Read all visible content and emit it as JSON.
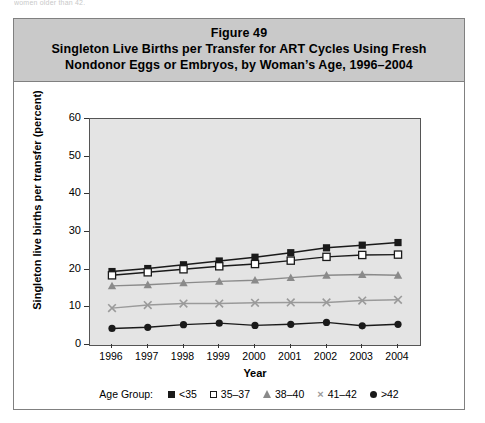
{
  "page": {
    "cut_off_top_text": "women older than 42."
  },
  "figure": {
    "figure_number": "Figure 49",
    "title_line_1": "Singleton Live Births per Transfer for ART Cycles Using Fresh",
    "title_line_2": "Nondonor Eggs or Embryos, by Woman’s Age, 1996–2004",
    "legend_title": "Age Group:"
  },
  "colors": {
    "title_band": "#c9c9c9",
    "plot_background": "#e4e4e4",
    "frame": "#808080",
    "series_lt35": "#1a1a1a",
    "series_35_37": "#1a1a1a",
    "series_38_40": "#8a8a8a",
    "series_41_42": "#9a9a9a",
    "series_gt42": "#1a1a1a"
  },
  "chart_data": {
    "type": "line",
    "xlabel": "Year",
    "ylabel": "Singleton live births per transfer (percent)",
    "categories": [
      "1996",
      "1997",
      "1998",
      "1999",
      "2000",
      "2001",
      "2002",
      "2003",
      "2004"
    ],
    "x": [
      1996,
      1997,
      1998,
      1999,
      2000,
      2001,
      2002,
      2003,
      2004
    ],
    "ylim": [
      0,
      60
    ],
    "yticks": [
      0,
      10,
      20,
      30,
      40,
      50,
      60
    ],
    "grid": false,
    "legend_position": "bottom",
    "series": [
      {
        "name": "<35",
        "marker": "filled-square",
        "color": "#1a1a1a",
        "values": [
          19.5,
          20.3,
          21.3,
          22.3,
          23.3,
          24.5,
          25.8,
          26.5,
          27.2
        ]
      },
      {
        "name": "35–37",
        "marker": "open-square",
        "color": "#1a1a1a",
        "values": [
          18.5,
          19.3,
          20.1,
          20.9,
          21.5,
          22.4,
          23.4,
          23.9,
          24.0
        ]
      },
      {
        "name": "38–40",
        "marker": "filled-triangle",
        "color": "#8a8a8a",
        "values": [
          15.7,
          16.0,
          16.5,
          16.9,
          17.2,
          17.9,
          18.5,
          18.7,
          18.5
        ]
      },
      {
        "name": "41–42",
        "marker": "cross-x",
        "color": "#9a9a9a",
        "values": [
          9.8,
          10.6,
          11.0,
          11.0,
          11.2,
          11.3,
          11.3,
          11.8,
          12.0
        ]
      },
      {
        "name": ">42",
        "marker": "filled-circle",
        "color": "#1a1a1a",
        "values": [
          4.4,
          4.7,
          5.4,
          5.8,
          5.2,
          5.5,
          6.0,
          5.1,
          5.5
        ]
      }
    ]
  }
}
